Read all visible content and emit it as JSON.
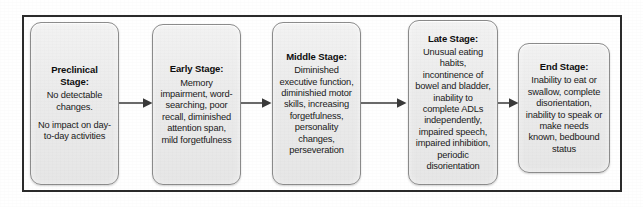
{
  "diagram": {
    "type": "linear-progression-flowchart",
    "title_visible": false,
    "orientation": "left-to-right",
    "frame": {
      "border_color": "#2b2b2b"
    },
    "box_style": {
      "fill_color": "#ebebeb",
      "border_color": "#8c8c8c",
      "text_color": "#151515",
      "corner": "rounded"
    },
    "arrow_color": "#3a3a3a",
    "stages": [
      {
        "id": "preclinical-stage",
        "title": "Preclinical Stage:",
        "paragraphs": [
          "No detectable changes.",
          "No impact on day-to-day activities"
        ]
      },
      {
        "id": "early-stage",
        "title": "Early Stage:",
        "paragraphs": [
          "Memory impairment, word-searching, poor recall, diminished attention span, mild forgetfulness"
        ]
      },
      {
        "id": "middle-stage",
        "title": "Middle Stage:",
        "paragraphs": [
          "Diminished executive function, diminishied motor skills, increasing forgetfulness, personality changes, perseveration"
        ]
      },
      {
        "id": "late-stage",
        "title": "Late Stage:",
        "paragraphs": [
          "Unusual eating habits, incontinence of bowel and bladder, inability to complete ADLs independently, impaired speech, impaired inhibition, periodic disorientation"
        ]
      },
      {
        "id": "end-stage",
        "title": "End Stage:",
        "paragraphs": [
          "Inability to eat or swallow, complete disorientation, inability to speak or make needs known, bedbound status"
        ]
      }
    ],
    "connectors": [
      {
        "id": "arrow-preclinical-to-early",
        "from": "preclinical-stage",
        "to": "early-stage"
      },
      {
        "id": "arrow-early-to-middle",
        "from": "early-stage",
        "to": "middle-stage"
      },
      {
        "id": "arrow-middle-to-late",
        "from": "middle-stage",
        "to": "late-stage"
      },
      {
        "id": "arrow-late-to-end",
        "from": "late-stage",
        "to": "end-stage"
      }
    ]
  }
}
